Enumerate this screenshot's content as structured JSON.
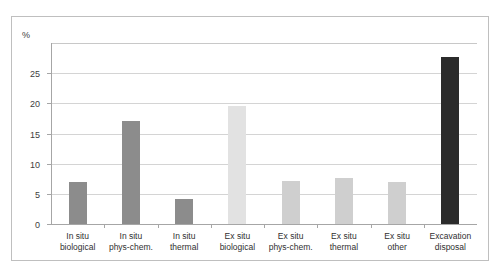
{
  "chart_data": {
    "type": "bar",
    "title": "",
    "subtitle": "",
    "xlabel": "",
    "ylabel": "%",
    "ylim": [
      0,
      30
    ],
    "grid": true,
    "legend": false,
    "legend_position": "none",
    "y_unit": "%",
    "y_ticks": [
      0,
      5,
      10,
      15,
      20,
      25
    ],
    "y_tick_labels": [
      "0",
      "5",
      "10",
      "15",
      "20",
      "25"
    ],
    "categories": [
      "In situ\nbiological",
      "In situ\nphys-chem.",
      "In situ\nthermal",
      "Ex situ\nbiological",
      "Ex situ\nphys-chem.",
      "Ex situ\nthermal",
      "Ex situ\nother",
      "Excavation\ndisposal"
    ],
    "values": [
      7.0,
      17.0,
      4.1,
      19.5,
      7.2,
      7.6,
      6.9,
      27.6
    ],
    "bar_colors": [
      "#8c8c8c",
      "#8c8c8c",
      "#8c8c8c",
      "#e2e2e2",
      "#cfcfcf",
      "#cfcfcf",
      "#cfcfcf",
      "#2b2b2b"
    ]
  },
  "style": {
    "frame_color": "#bfbfbf",
    "gridline_color": "#d4d4d4",
    "axis_color": "#a6a6a6",
    "text_color": "#303030"
  }
}
